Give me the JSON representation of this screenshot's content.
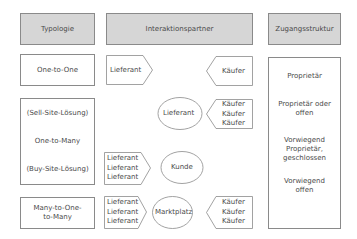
{
  "headers": {
    "typologie": "Typologie",
    "interaktionspartner": "Interaktionspartner",
    "zugangsstruktur": "Zugangsstruktur"
  },
  "typologie": {
    "one_to_one": "One-to-One",
    "sell_site": "(Sell-Site-Lösung)",
    "one_to_many": "One-to-Many",
    "buy_site": "(Buy-Site-Lösung)",
    "many_to_one_to_many": "Many-to-One-\nto-Many"
  },
  "interaktion": {
    "row1": {
      "left": "Lieferant",
      "right": "Käufer"
    },
    "row2": {
      "center": "Lieferant",
      "right": [
        "Käufer",
        "Käufer",
        "Käufer"
      ]
    },
    "row3": {
      "left": [
        "Lieferant",
        "Lieferant",
        "Lieferant"
      ],
      "center": "Kunde"
    },
    "row4": {
      "left": [
        "Lieferant",
        "Lieferant",
        "Lieferant"
      ],
      "center": "Marktplatz",
      "right": [
        "Käufer",
        "Käufer",
        "Käufer"
      ]
    }
  },
  "zugang": {
    "item1": "Proprietär",
    "item2": "Proprietär oder\noffen",
    "item3": "Vorwiegend\nProprietär,\ngeschlossen",
    "item4": "Vorwiegend\noffen"
  },
  "colors": {
    "header_fill": "#d6d6d6",
    "border": "#8a8a8a",
    "text": "#4a4a4a",
    "shape_fill": "#ffffff"
  }
}
